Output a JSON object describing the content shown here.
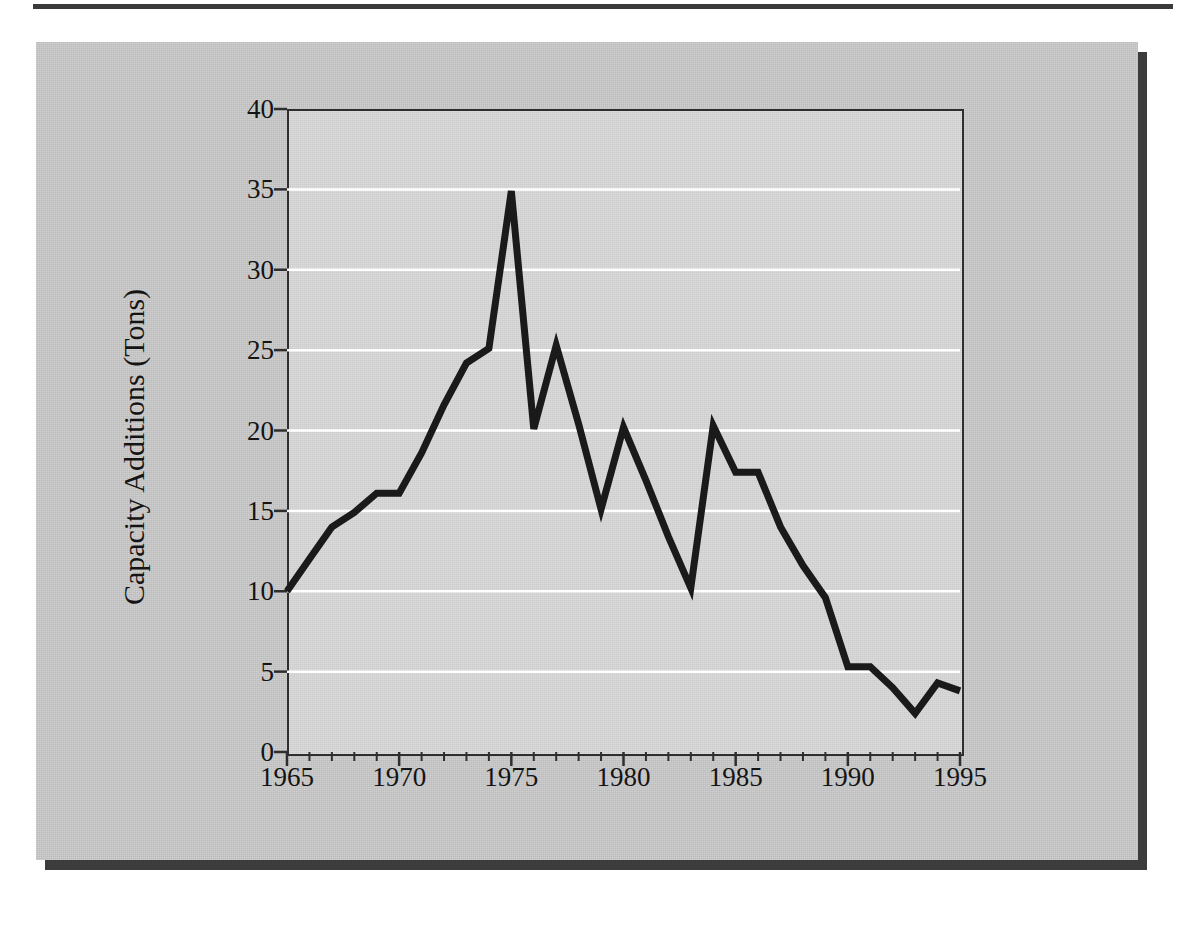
{
  "figure": {
    "panel_bg": "#c9c9c9",
    "plot_bg": "#d6d6d6",
    "line_color": "#1a1a1a",
    "gridline_color": "#ffffff",
    "axis_color": "#2e2e2e",
    "shadow_color": "#3c3c3c"
  },
  "chart_data": {
    "type": "line",
    "title": "",
    "xlabel": "",
    "ylabel": "Capacity Additions (Tons)",
    "xlim": [
      1965,
      1995
    ],
    "ylim": [
      0,
      40
    ],
    "grid": true,
    "grid_axis": "y",
    "legend": "none",
    "ytick_labels": [
      "0",
      "5",
      "10",
      "15",
      "20",
      "25",
      "30",
      "35",
      "40"
    ],
    "ytick_values": [
      0,
      5,
      10,
      15,
      20,
      25,
      30,
      35,
      40
    ],
    "xtick_labels": [
      "1965",
      "1970",
      "1975",
      "1980",
      "1985",
      "1990",
      "1995"
    ],
    "xtick_values": [
      1965,
      1970,
      1975,
      1980,
      1985,
      1990,
      1995
    ],
    "xminor_step": 1,
    "series": [
      {
        "name": "Capacity Additions",
        "x": [
          1965,
          1966,
          1967,
          1968,
          1969,
          1970,
          1971,
          1972,
          1973,
          1974,
          1975,
          1976,
          1977,
          1978,
          1979,
          1980,
          1981,
          1982,
          1983,
          1984,
          1985,
          1986,
          1987,
          1988,
          1989,
          1990,
          1991,
          1992,
          1993,
          1994,
          1995
        ],
        "values": [
          10.0,
          12.0,
          14.0,
          14.9,
          16.1,
          16.1,
          18.6,
          21.6,
          24.2,
          25.1,
          34.9,
          20.1,
          25.3,
          20.4,
          15.1,
          20.2,
          16.9,
          13.4,
          10.2,
          20.3,
          17.4,
          17.4,
          14.0,
          11.6,
          9.6,
          5.3,
          5.3,
          4.0,
          2.4,
          4.3,
          3.8
        ]
      }
    ]
  }
}
